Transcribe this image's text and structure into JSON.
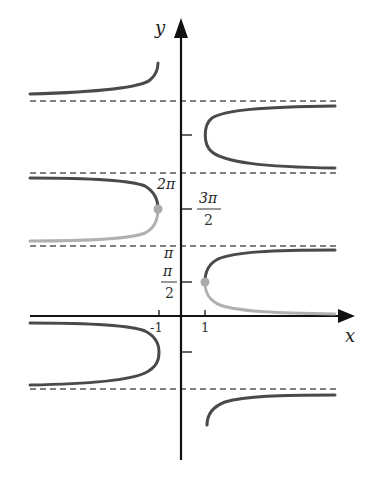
{
  "diagram": {
    "axes": {
      "x_label": "x",
      "y_label": "y",
      "x_ticks": [
        {
          "label": "-1",
          "value": -1
        },
        {
          "label": "1",
          "value": 1
        }
      ],
      "y_ticks": [
        {
          "label_num": "π",
          "label_den": "2",
          "value": "π/2",
          "fraction": true
        },
        {
          "label": "π",
          "value": "π",
          "fraction": false
        },
        {
          "label_num": "3π",
          "label_den": "2",
          "value": "3π/2",
          "fraction": true
        },
        {
          "label": "2π",
          "value": "2π",
          "fraction": false
        }
      ]
    },
    "asymptotes": [
      "3π",
      "2π",
      "π",
      "0",
      "-π"
    ],
    "colors": {
      "curve_dark": "#4a4a4a",
      "curve_light": "#b0b0b0",
      "axis": "#111111",
      "dashed": "#555555",
      "point": "#aaaaaa"
    },
    "highlighted_points": [
      {
        "x": 1,
        "y": "π/2"
      },
      {
        "x": -1,
        "y": "3π/2"
      }
    ]
  }
}
